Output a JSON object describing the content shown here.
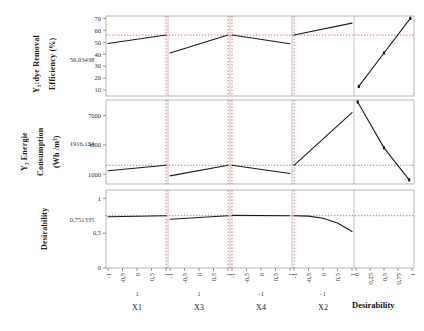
{
  "figure": {
    "type": "optimization-plot",
    "desirability_label": "Desirability"
  },
  "rows": [
    {
      "id": "y1",
      "label_lines": [
        "Y₁:dye Removal",
        "Efficiency (%)"
      ],
      "current_value": "56,03438",
      "y_ticks": [
        "70",
        "60",
        "50",
        "40",
        "30",
        "20",
        "10"
      ],
      "ylim": [
        5,
        72
      ],
      "reference_y": 56.03438
    },
    {
      "id": "y2",
      "label_lines": [
        "Y₂ Energie",
        "Consumption",
        "(Wh /m³)"
      ],
      "current_value": "1916,154",
      "y_ticks": [
        "7000",
        "4000",
        "1000"
      ],
      "ylim": [
        0,
        8600
      ],
      "reference_y": 1916.154
    },
    {
      "id": "d",
      "label_lines": [
        "Desirability"
      ],
      "current_value": "0,751335",
      "y_ticks": [
        "1",
        "0,5",
        "0"
      ],
      "ylim": [
        0,
        1.12
      ],
      "reference_y": 0.751335
    }
  ],
  "columns": [
    {
      "name": "X1",
      "setting": "1",
      "x_ticks": [
        "-1",
        "-0,5",
        "0",
        "0,5",
        "1"
      ],
      "xlim": [
        -1,
        1
      ],
      "marker_x": 1
    },
    {
      "name": "X3",
      "setting": "1",
      "x_ticks": [
        "-1",
        "-0,5",
        "0",
        "0,5",
        "1"
      ],
      "xlim": [
        -1,
        1
      ],
      "marker_x": 1
    },
    {
      "name": "X4",
      "setting": "-1",
      "x_ticks": [
        "-1",
        "-0,5",
        "0",
        "0,5",
        "1"
      ],
      "xlim": [
        -1,
        1
      ],
      "marker_x": -1
    },
    {
      "name": "X2",
      "setting": "-1",
      "x_ticks": [
        "-1",
        "-0,5",
        "0",
        "0,5",
        "1"
      ],
      "xlim": [
        -1,
        1
      ],
      "marker_x": -1
    },
    {
      "name": "Desirability",
      "setting": "",
      "x_ticks": [
        "0",
        "0,25",
        "0,5",
        "0,75",
        "1"
      ],
      "xlim": [
        0,
        1
      ],
      "marker_x": null
    }
  ],
  "chart_data": {
    "type": "line",
    "title": "",
    "xlabel": "",
    "ylabel": "",
    "grid": false,
    "legend": "none",
    "panels": [
      {
        "row": "Y1:dye Removal Efficiency (%)",
        "column": "X1",
        "x": [
          -1,
          1
        ],
        "y": [
          49,
          56.03
        ],
        "ylim": [
          5,
          72
        ],
        "xlim": [
          -1,
          1
        ]
      },
      {
        "row": "Y1:dye Removal Efficiency (%)",
        "column": "X3",
        "x": [
          -1,
          1
        ],
        "y": [
          41,
          56.03
        ],
        "ylim": [
          5,
          72
        ],
        "xlim": [
          -1,
          1
        ]
      },
      {
        "row": "Y1:dye Removal Efficiency (%)",
        "column": "X4",
        "x": [
          -1,
          1
        ],
        "y": [
          56.03,
          48.8
        ],
        "ylim": [
          5,
          72
        ],
        "xlim": [
          -1,
          1
        ]
      },
      {
        "row": "Y1:dye Removal Efficiency (%)",
        "column": "X2",
        "x": [
          -1,
          1
        ],
        "y": [
          56.03,
          66
        ],
        "ylim": [
          5,
          72
        ],
        "xlim": [
          -1,
          1
        ]
      },
      {
        "row": "Y1:dye Removal Efficiency (%)",
        "column": "Desirability",
        "x": [
          0.05,
          0.5,
          0.97
        ],
        "y": [
          13,
          41,
          70
        ],
        "ylim": [
          5,
          72
        ],
        "xlim": [
          0,
          1
        ]
      },
      {
        "row": "Y2 Energie Consumption (Wh /m3)",
        "column": "X1",
        "x": [
          -1,
          1
        ],
        "y": [
          1350,
          1916
        ],
        "ylim": [
          0,
          8600
        ],
        "xlim": [
          -1,
          1
        ]
      },
      {
        "row": "Y2 Energie Consumption (Wh /m3)",
        "column": "X3",
        "x": [
          -1,
          1
        ],
        "y": [
          830,
          1916
        ],
        "ylim": [
          0,
          8600
        ],
        "xlim": [
          -1,
          1
        ]
      },
      {
        "row": "Y2 Energie Consumption (Wh /m3)",
        "column": "X4",
        "x": [
          -1,
          1
        ],
        "y": [
          1916,
          1080
        ],
        "ylim": [
          0,
          8600
        ],
        "xlim": [
          -1,
          1
        ]
      },
      {
        "row": "Y2 Energie Consumption (Wh /m3)",
        "column": "X2",
        "x": [
          -1,
          1
        ],
        "y": [
          1916,
          7300
        ],
        "ylim": [
          0,
          8600
        ],
        "xlim": [
          -1,
          1
        ]
      },
      {
        "row": "Y2 Energie Consumption (Wh /m3)",
        "column": "Desirability",
        "x": [
          0.03,
          0.5,
          0.95
        ],
        "y": [
          8400,
          3700,
          420
        ],
        "ylim": [
          0,
          8600
        ],
        "xlim": [
          0,
          1
        ]
      },
      {
        "row": "Desirability",
        "column": "X1",
        "x": [
          -1,
          1
        ],
        "y": [
          0.735,
          0.751
        ],
        "ylim": [
          0,
          1.12
        ],
        "xlim": [
          -1,
          1
        ]
      },
      {
        "row": "Desirability",
        "column": "X3",
        "x": [
          -1,
          1
        ],
        "y": [
          0.7,
          0.751
        ],
        "ylim": [
          0,
          1.12
        ],
        "xlim": [
          -1,
          1
        ]
      },
      {
        "row": "Desirability",
        "column": "X4",
        "x": [
          -1,
          1
        ],
        "y": [
          0.755,
          0.751
        ],
        "ylim": [
          0,
          1.12
        ],
        "xlim": [
          -1,
          1
        ]
      },
      {
        "row": "Desirability",
        "column": "X2",
        "x": [
          -1,
          -0.5,
          0,
          0.5,
          1
        ],
        "y": [
          0.751,
          0.745,
          0.715,
          0.645,
          0.525
        ],
        "ylim": [
          0,
          1.12
        ],
        "xlim": [
          -1,
          1
        ]
      },
      {
        "row": "Desirability",
        "column": "Desirability",
        "x": [],
        "y": [],
        "ylim": [
          0,
          1.12
        ],
        "xlim": [
          0,
          1
        ]
      }
    ]
  }
}
